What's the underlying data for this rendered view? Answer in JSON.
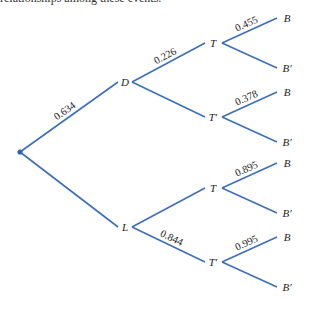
{
  "header": {
    "partial_text": "relationships among these events."
  },
  "tree": {
    "root": {
      "x": 20,
      "y": 152
    },
    "colors": {
      "edge": "#3c6fb6",
      "root_dot": "#2f64b5",
      "text": "#222222"
    },
    "level1": [
      {
        "id": "D",
        "label": "D",
        "x": 125,
        "y": 82,
        "prob": "0.634"
      },
      {
        "id": "L",
        "label": "L",
        "x": 125,
        "y": 227,
        "prob": ""
      }
    ],
    "level2": [
      {
        "parent": "D",
        "label": "T",
        "x": 213,
        "y": 43,
        "prob": "0.226"
      },
      {
        "parent": "D",
        "label": "T′",
        "x": 213,
        "y": 117,
        "prob": ""
      },
      {
        "parent": "L",
        "label": "T",
        "x": 213,
        "y": 188,
        "prob": ""
      },
      {
        "parent": "L",
        "label": "T′",
        "x": 213,
        "y": 262,
        "prob": "0.844"
      }
    ],
    "level3": [
      {
        "parent_index": 0,
        "label": "B",
        "x": 285,
        "y": 18,
        "prob": "0.455"
      },
      {
        "parent_index": 0,
        "label": "B′",
        "x": 285,
        "y": 68,
        "prob": ""
      },
      {
        "parent_index": 1,
        "label": "B",
        "x": 285,
        "y": 92,
        "prob": "0.378"
      },
      {
        "parent_index": 1,
        "label": "B′",
        "x": 285,
        "y": 142,
        "prob": ""
      },
      {
        "parent_index": 2,
        "label": "B",
        "x": 285,
        "y": 163,
        "prob": "0.895"
      },
      {
        "parent_index": 2,
        "label": "B′",
        "x": 285,
        "y": 213,
        "prob": ""
      },
      {
        "parent_index": 3,
        "label": "B",
        "x": 285,
        "y": 237,
        "prob": "0.995"
      },
      {
        "parent_index": 3,
        "label": "B′",
        "x": 285,
        "y": 287,
        "prob": ""
      }
    ]
  }
}
